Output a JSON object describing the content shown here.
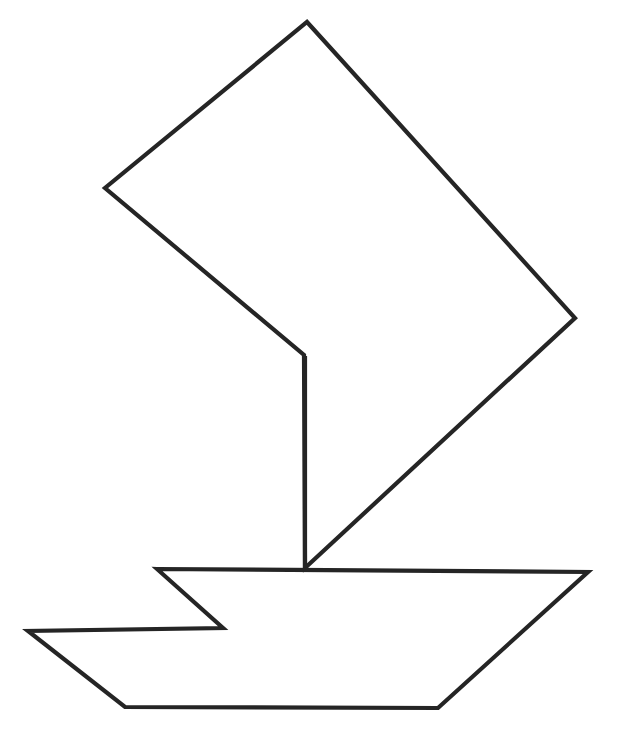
{
  "document": {
    "title": "Sailboat Line Drawing",
    "kind": "line-art-illustration",
    "subject": "sailboat"
  },
  "canvas": {
    "width": 631,
    "height": 748,
    "background_color": "#ffffff"
  },
  "style": {
    "stroke_color": "#252525",
    "stroke_width": 4.2,
    "fill_color": "none"
  },
  "shapes": {
    "sail": {
      "label": "Sail",
      "description": "Large tilted quadrilateral sail with a notch on the lower left, open outline",
      "points": "307,22 575,318 305,568 304,355 105,188",
      "closed": true,
      "vertices": [
        {
          "name": "sail-apex-top",
          "x": 307,
          "y": 22
        },
        {
          "name": "sail-corner-right",
          "x": 575,
          "y": 318
        },
        {
          "name": "sail-foot-at-deck",
          "x": 305,
          "y": 568
        },
        {
          "name": "sail-notch-elbow",
          "x": 304,
          "y": 355
        },
        {
          "name": "sail-corner-left",
          "x": 105,
          "y": 188
        }
      ]
    },
    "mast": {
      "label": "Mast",
      "description": "Vertical line from sail notch down to the deck",
      "points": "305,356 305,569",
      "closed": false,
      "vertices": [
        {
          "name": "mast-top",
          "x": 305,
          "y": 356
        },
        {
          "name": "mast-base",
          "x": 305,
          "y": 569
        }
      ]
    },
    "hull": {
      "label": "Hull",
      "description": "Boat hull with deck line and a pennant-like zigzag extending to the left",
      "points": "157,569 588,572 438,708 125,707 28,631 223,628",
      "closed": true,
      "vertices": [
        {
          "name": "deck-left-corner",
          "x": 157,
          "y": 569
        },
        {
          "name": "deck-right-corner",
          "x": 588,
          "y": 572
        },
        {
          "name": "hull-bottom-right",
          "x": 438,
          "y": 708
        },
        {
          "name": "hull-bottom-left",
          "x": 125,
          "y": 707
        },
        {
          "name": "pennant-far-left-tip",
          "x": 28,
          "y": 631
        },
        {
          "name": "pennant-inner-notch",
          "x": 223,
          "y": 628
        }
      ]
    }
  }
}
